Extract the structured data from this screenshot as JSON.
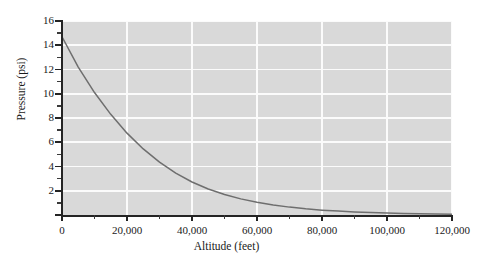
{
  "chart_data": {
    "type": "line",
    "title": "",
    "xlabel": "Altitude (feet)",
    "ylabel": "Pressure (psi)",
    "xlim": [
      0,
      120000
    ],
    "ylim": [
      0,
      16
    ],
    "grid": true,
    "legend": null,
    "x_tick_labels": [
      "0",
      "20,000",
      "40,000",
      "60,000",
      "80,000",
      "100,000",
      "120,000"
    ],
    "x_tick_values": [
      0,
      20000,
      40000,
      60000,
      80000,
      100000,
      120000
    ],
    "x_minor_tick_values": [
      10000,
      30000,
      50000,
      70000,
      90000,
      110000
    ],
    "y_tick_labels": [
      "0",
      "2",
      "4",
      "6",
      "8",
      "10",
      "12",
      "14",
      "16"
    ],
    "y_tick_values": [
      0,
      2,
      4,
      6,
      8,
      10,
      12,
      14,
      16
    ],
    "y_minor_tick_values": [
      1,
      3,
      5,
      7,
      9,
      11,
      13,
      15
    ],
    "series": [
      {
        "name": "Atmospheric pressure vs altitude",
        "color": "#6e6e6e",
        "x": [
          0,
          5000,
          10000,
          15000,
          20000,
          25000,
          30000,
          35000,
          40000,
          45000,
          50000,
          55000,
          60000,
          65000,
          70000,
          75000,
          80000,
          85000,
          90000,
          95000,
          100000,
          105000,
          110000,
          115000,
          120000
        ],
        "y": [
          14.7,
          12.2,
          10.1,
          8.3,
          6.75,
          5.45,
          4.36,
          3.46,
          2.72,
          2.14,
          1.69,
          1.33,
          1.05,
          0.83,
          0.65,
          0.51,
          0.4,
          0.32,
          0.25,
          0.2,
          0.16,
          0.12,
          0.1,
          0.08,
          0.06
        ]
      }
    ]
  },
  "colors": {
    "plot_background": "#d9d9d9",
    "gridline": "#fbfbfb",
    "axis": "#242424",
    "curve": "#6e6e6e",
    "page_background": "#ffffff"
  }
}
